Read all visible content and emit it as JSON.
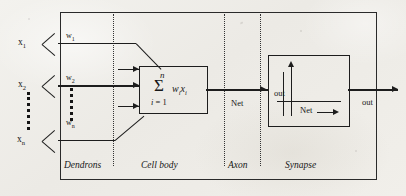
{
  "diagram": {
    "regions": [
      {
        "id": "dendrons",
        "label": "Dendrons"
      },
      {
        "id": "cell-body",
        "label": "Cell body"
      },
      {
        "id": "axon",
        "label": "Axon"
      },
      {
        "id": "synapse",
        "label": "Synapse"
      }
    ],
    "inputs": [
      {
        "signal": "x",
        "signal_sub": "1",
        "weight": "w",
        "weight_sub": "1"
      },
      {
        "signal": "x",
        "signal_sub": "2",
        "weight": "w",
        "weight_sub": "2"
      },
      {
        "signal": "x",
        "signal_sub": "n",
        "weight": "w",
        "weight_sub": "n"
      }
    ],
    "ellipsis": {
      "symbol": "⋮",
      "between_inputs": "x2 and xn",
      "between_weights": "w2 and wn"
    },
    "summation": {
      "upper_limit": "n",
      "sigma": "Σ",
      "term": "w",
      "term_sub_1": "i",
      "term_2": "x",
      "term_sub_2": "i",
      "lower_limit_var": "i",
      "lower_limit_eq": "= 1"
    },
    "axon": {
      "signal_label": "Net"
    },
    "synapse_plot": {
      "y_axis_label": "out",
      "x_axis_label": "Net"
    },
    "output": {
      "label": "out"
    },
    "colors": {
      "ink": "#1d1d1d",
      "frame": "#2a2a2a",
      "paper": "#efeeea"
    }
  }
}
